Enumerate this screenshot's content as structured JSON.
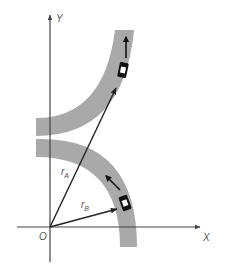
{
  "diagram": {
    "axes": {
      "x_label": "X",
      "y_label": "Y",
      "origin_label": "O"
    },
    "vectors": [
      {
        "name": "r",
        "subscript": "A",
        "target": "car A"
      },
      {
        "name": "r",
        "subscript": "B",
        "target": "car B"
      }
    ],
    "roads": [
      {
        "name": "upper road",
        "curvature": "concave right"
      },
      {
        "name": "lower road",
        "curvature": "arc about origin"
      }
    ],
    "cars": [
      {
        "name": "car A",
        "direction_icon": "arrow-up-icon"
      },
      {
        "name": "car B",
        "direction_icon": "arrow-up-left-icon"
      }
    ],
    "colors": {
      "road": "#a9a9a9",
      "axis": "#444444",
      "vector": "#222222",
      "car": "#111111",
      "label": "#555555"
    }
  }
}
